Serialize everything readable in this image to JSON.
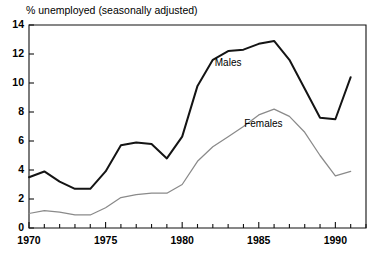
{
  "chart_data": {
    "type": "line",
    "title": "% unemployed (seasonally adjusted)",
    "xlabel": "",
    "ylabel": "",
    "xlim": [
      1970,
      1992
    ],
    "ylim": [
      0,
      14
    ],
    "yticks": [
      0,
      2,
      4,
      6,
      8,
      10,
      12,
      14
    ],
    "ytick_labels": [
      "0",
      "2",
      "4",
      "6",
      "8",
      "10",
      "12",
      "14"
    ],
    "xticks": [
      1970,
      1975,
      1980,
      1985,
      1990
    ],
    "xtick_labels": [
      "1970",
      "1975",
      "1980",
      "1985",
      "1990"
    ],
    "x_minor_tick_interval": 1,
    "grid": false,
    "legend_position": "inline-annotations",
    "x": [
      1970,
      1971,
      1972,
      1973,
      1974,
      1975,
      1976,
      1977,
      1978,
      1979,
      1980,
      1981,
      1982,
      1983,
      1984,
      1985,
      1986,
      1987,
      1988,
      1989,
      1990,
      1991
    ],
    "series": [
      {
        "name": "Males",
        "color": "#141414",
        "label_x": 1983.0,
        "label_y": 11.2,
        "values": [
          3.5,
          3.9,
          3.2,
          2.7,
          2.7,
          3.9,
          5.7,
          5.9,
          5.8,
          4.8,
          6.3,
          9.8,
          11.6,
          12.2,
          12.3,
          12.7,
          12.9,
          11.6,
          9.6,
          7.6,
          7.5,
          10.4
        ]
      },
      {
        "name": "Females",
        "color": "#8a8a8a",
        "label_x": 1985.3,
        "label_y": 7.0,
        "values": [
          1.0,
          1.2,
          1.1,
          0.9,
          0.9,
          1.4,
          2.1,
          2.3,
          2.4,
          2.4,
          3.0,
          4.6,
          5.6,
          6.3,
          7.0,
          7.8,
          8.2,
          7.7,
          6.6,
          5.0,
          3.6,
          3.9
        ]
      }
    ]
  },
  "plot_geometry": {
    "left": 29,
    "right": 366,
    "top": 25,
    "bottom": 228,
    "title_x": 26,
    "title_y": 14
  }
}
